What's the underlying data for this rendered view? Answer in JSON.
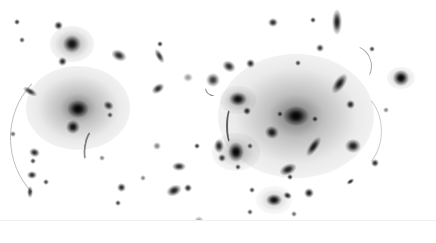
{
  "image": {
    "description": "Inverted (negative) deep-field image of a galaxy cluster with gravitational lensing arcs",
    "width": 436,
    "height": 243,
    "colors": {
      "background": "#ffffff",
      "ink": "#000000"
    }
  },
  "halos": [
    {
      "x": 78,
      "y": 108,
      "r": 52,
      "opacity": 0.55
    },
    {
      "x": 296,
      "y": 116,
      "r": 78,
      "opacity": 0.55
    },
    {
      "x": 72,
      "y": 44,
      "r": 22,
      "opacity": 0.5
    },
    {
      "x": 236,
      "y": 152,
      "r": 24,
      "opacity": 0.4
    },
    {
      "x": 238,
      "y": 100,
      "r": 18,
      "opacity": 0.4
    },
    {
      "x": 274,
      "y": 200,
      "r": 18,
      "opacity": 0.3
    },
    {
      "x": 401,
      "y": 78,
      "r": 14,
      "opacity": 0.4
    }
  ],
  "sources": [
    {
      "x": 78,
      "y": 109,
      "w": 12,
      "h": 10,
      "rot": 0,
      "o": 1.0
    },
    {
      "x": 73,
      "y": 127,
      "w": 8,
      "h": 8,
      "rot": 0,
      "o": 0.95
    },
    {
      "x": 72,
      "y": 44,
      "w": 10,
      "h": 10,
      "rot": 0,
      "o": 0.9
    },
    {
      "x": 58,
      "y": 25,
      "w": 5,
      "h": 5,
      "rot": 0,
      "o": 0.85
    },
    {
      "x": 62,
      "y": 61,
      "w": 5,
      "h": 5,
      "rot": 0,
      "o": 0.85
    },
    {
      "x": 17,
      "y": 22,
      "w": 3,
      "h": 3,
      "rot": 0,
      "o": 0.8
    },
    {
      "x": 22,
      "y": 40,
      "w": 3,
      "h": 3,
      "rot": 0,
      "o": 0.7
    },
    {
      "x": 119,
      "y": 55,
      "w": 9,
      "h": 6,
      "rot": 25,
      "o": 0.85
    },
    {
      "x": 160,
      "y": 56,
      "w": 4,
      "h": 9,
      "rot": -30,
      "o": 0.8
    },
    {
      "x": 160,
      "y": 44,
      "w": 3,
      "h": 3,
      "rot": 0,
      "o": 0.8
    },
    {
      "x": 158,
      "y": 88,
      "w": 8,
      "h": 5,
      "rot": -35,
      "o": 0.85
    },
    {
      "x": 30,
      "y": 92,
      "w": 9,
      "h": 4,
      "rot": 30,
      "o": 0.8
    },
    {
      "x": 108,
      "y": 105,
      "w": 6,
      "h": 5,
      "rot": 30,
      "o": 0.8
    },
    {
      "x": 110,
      "y": 115,
      "w": 3,
      "h": 3,
      "rot": 0,
      "o": 0.7
    },
    {
      "x": 188,
      "y": 77,
      "w": 6,
      "h": 5,
      "rot": 0,
      "o": 0.4
    },
    {
      "x": 213,
      "y": 80,
      "w": 8,
      "h": 8,
      "rot": 0,
      "o": 0.8
    },
    {
      "x": 229,
      "y": 66,
      "w": 8,
      "h": 6,
      "rot": 30,
      "o": 0.85
    },
    {
      "x": 273,
      "y": 22,
      "w": 6,
      "h": 5,
      "rot": 0,
      "o": 0.85
    },
    {
      "x": 337,
      "y": 22,
      "w": 6,
      "h": 14,
      "rot": 0,
      "o": 0.9
    },
    {
      "x": 313,
      "y": 20,
      "w": 3,
      "h": 3,
      "rot": 0,
      "o": 0.8
    },
    {
      "x": 320,
      "y": 48,
      "w": 4,
      "h": 4,
      "rot": 0,
      "o": 0.8
    },
    {
      "x": 250,
      "y": 63,
      "w": 5,
      "h": 5,
      "rot": 0,
      "o": 0.85
    },
    {
      "x": 298,
      "y": 63,
      "w": 3,
      "h": 3,
      "rot": 0,
      "o": 0.75
    },
    {
      "x": 339,
      "y": 84,
      "w": 6,
      "h": 13,
      "rot": 35,
      "o": 0.9
    },
    {
      "x": 401,
      "y": 78,
      "w": 9,
      "h": 9,
      "rot": 0,
      "o": 1.0
    },
    {
      "x": 372,
      "y": 49,
      "w": 3,
      "h": 3,
      "rot": 0,
      "o": 0.75
    },
    {
      "x": 238,
      "y": 99,
      "w": 10,
      "h": 8,
      "rot": 0,
      "o": 0.95
    },
    {
      "x": 247,
      "y": 111,
      "w": 4,
      "h": 4,
      "rot": 0,
      "o": 0.85
    },
    {
      "x": 296,
      "y": 116,
      "w": 14,
      "h": 11,
      "rot": 0,
      "o": 1.0
    },
    {
      "x": 315,
      "y": 119,
      "w": 3,
      "h": 3,
      "rot": 0,
      "o": 0.8
    },
    {
      "x": 280,
      "y": 114,
      "w": 3,
      "h": 3,
      "rot": 0,
      "o": 0.75
    },
    {
      "x": 272,
      "y": 132,
      "w": 8,
      "h": 7,
      "rot": 20,
      "o": 0.9
    },
    {
      "x": 350,
      "y": 104,
      "w": 5,
      "h": 5,
      "rot": 0,
      "o": 0.85
    },
    {
      "x": 313,
      "y": 147,
      "w": 5,
      "h": 13,
      "rot": 35,
      "o": 0.9
    },
    {
      "x": 353,
      "y": 146,
      "w": 9,
      "h": 8,
      "rot": 0,
      "o": 0.9
    },
    {
      "x": 375,
      "y": 163,
      "w": 4,
      "h": 4,
      "rot": 0,
      "o": 0.85
    },
    {
      "x": 219,
      "y": 146,
      "w": 6,
      "h": 8,
      "rot": 0,
      "o": 0.85
    },
    {
      "x": 236,
      "y": 152,
      "w": 9,
      "h": 11,
      "rot": 0,
      "o": 1.0
    },
    {
      "x": 222,
      "y": 158,
      "w": 4,
      "h": 4,
      "rot": 0,
      "o": 0.8
    },
    {
      "x": 238,
      "y": 167,
      "w": 3,
      "h": 3,
      "rot": 0,
      "o": 0.75
    },
    {
      "x": 197,
      "y": 146,
      "w": 3,
      "h": 3,
      "rot": 0,
      "o": 0.8
    },
    {
      "x": 288,
      "y": 169,
      "w": 10,
      "h": 6,
      "rot": -25,
      "o": 0.9
    },
    {
      "x": 290,
      "y": 177,
      "w": 3,
      "h": 3,
      "rot": 0,
      "o": 0.8
    },
    {
      "x": 252,
      "y": 190,
      "w": 3,
      "h": 3,
      "rot": 0,
      "o": 0.75
    },
    {
      "x": 274,
      "y": 200,
      "w": 9,
      "h": 7,
      "rot": 0,
      "o": 0.95
    },
    {
      "x": 287,
      "y": 196,
      "w": 5,
      "h": 4,
      "rot": 25,
      "o": 0.85
    },
    {
      "x": 309,
      "y": 193,
      "w": 6,
      "h": 6,
      "rot": 0,
      "o": 0.9
    },
    {
      "x": 350,
      "y": 182,
      "w": 5,
      "h": 3,
      "rot": -35,
      "o": 0.85
    },
    {
      "x": 250,
      "y": 146,
      "w": 3,
      "h": 3,
      "rot": 0,
      "o": 0.7
    },
    {
      "x": 250,
      "y": 212,
      "w": 3,
      "h": 3,
      "rot": 0,
      "o": 0.7
    },
    {
      "x": 294,
      "y": 214,
      "w": 3,
      "h": 3,
      "rot": 0,
      "o": 0.6
    },
    {
      "x": 179,
      "y": 166,
      "w": 8,
      "h": 5,
      "rot": 0,
      "o": 0.85
    },
    {
      "x": 174,
      "y": 190,
      "w": 9,
      "h": 6,
      "rot": -25,
      "o": 0.9
    },
    {
      "x": 188,
      "y": 188,
      "w": 4,
      "h": 4,
      "rot": 0,
      "o": 0.85
    },
    {
      "x": 121,
      "y": 187,
      "w": 5,
      "h": 5,
      "rot": 0,
      "o": 0.85
    },
    {
      "x": 118,
      "y": 203,
      "w": 3,
      "h": 3,
      "rot": 0,
      "o": 0.75
    },
    {
      "x": 157,
      "y": 146,
      "w": 4,
      "h": 4,
      "rot": 0,
      "o": 0.5
    },
    {
      "x": 34,
      "y": 152,
      "w": 6,
      "h": 5,
      "rot": 20,
      "o": 0.85
    },
    {
      "x": 33,
      "y": 161,
      "w": 3,
      "h": 3,
      "rot": 0,
      "o": 0.75
    },
    {
      "x": 32,
      "y": 175,
      "w": 6,
      "h": 4,
      "rot": 0,
      "o": 0.85
    },
    {
      "x": 46,
      "y": 182,
      "w": 3,
      "h": 3,
      "rot": 0,
      "o": 0.75
    },
    {
      "x": 30,
      "y": 192,
      "w": 3,
      "h": 7,
      "rot": 0,
      "o": 0.8
    },
    {
      "x": 199,
      "y": 222,
      "w": 6,
      "h": 7,
      "rot": 0,
      "o": 0.5
    },
    {
      "x": 13,
      "y": 134,
      "w": 3,
      "h": 3,
      "rot": 0,
      "o": 0.6
    },
    {
      "x": 102,
      "y": 158,
      "w": 3,
      "h": 3,
      "rot": 0,
      "o": 0.5
    },
    {
      "x": 143,
      "y": 178,
      "w": 3,
      "h": 3,
      "rot": 0,
      "o": 0.5
    },
    {
      "x": 386,
      "y": 110,
      "w": 3,
      "h": 3,
      "rot": 0,
      "o": 0.5
    }
  ],
  "arcs": [
    {
      "x": 10,
      "y": 62,
      "w": 140,
      "h": 150,
      "rot": 0,
      "width": 1,
      "o": 0.25,
      "side": "left"
    },
    {
      "x": 226,
      "y": 108,
      "w": 6,
      "h": 32,
      "rot": 0,
      "width": 2,
      "o": 0.6,
      "side": "left"
    },
    {
      "x": 84,
      "y": 130,
      "w": 8,
      "h": 28,
      "rot": 10,
      "width": 2,
      "o": 0.45,
      "side": "left"
    },
    {
      "x": 330,
      "y": 45,
      "w": 40,
      "h": 40,
      "rot": -20,
      "width": 1,
      "o": 0.35,
      "side": "right"
    },
    {
      "x": 320,
      "y": 90,
      "w": 60,
      "h": 80,
      "rot": 0,
      "width": 1,
      "o": 0.2,
      "side": "right"
    },
    {
      "x": 205,
      "y": 80,
      "w": 14,
      "h": 14,
      "rot": 40,
      "width": 1,
      "o": 0.45,
      "side": "bottom"
    }
  ]
}
